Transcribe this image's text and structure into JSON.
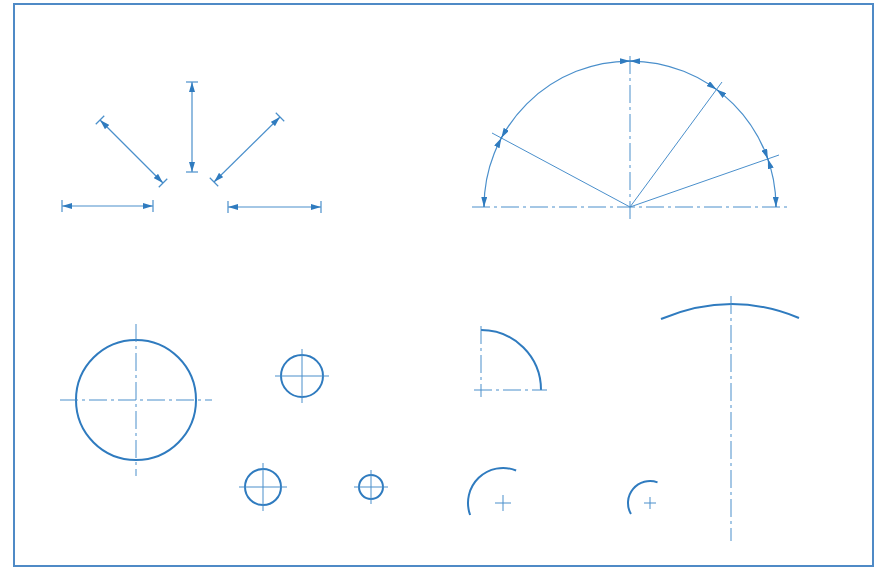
{
  "drawing": {
    "colors": {
      "line": "#2f7bbf",
      "thin": "#4a8fcb",
      "frame": "#4f8ac6",
      "background": "#ffffff"
    },
    "frame": {
      "x": 14,
      "y": 4,
      "w": 859,
      "h": 562
    },
    "dimension_arrows": [
      {
        "x1": 62,
        "y1": 206,
        "x2": 153,
        "y2": 206
      },
      {
        "x1": 100,
        "y1": 120,
        "x2": 163,
        "y2": 183
      },
      {
        "x1": 192,
        "y1": 82,
        "x2": 192,
        "y2": 172
      },
      {
        "x1": 280,
        "y1": 117,
        "x2": 214,
        "y2": 182
      },
      {
        "x1": 228,
        "y1": 207,
        "x2": 321,
        "y2": 207
      }
    ],
    "semicircle": {
      "cx": 630,
      "cy": 207,
      "r": 146,
      "centerline_h": {
        "x1": 472,
        "x2": 789
      },
      "centerline_v": {
        "y1": 56,
        "y2": 220
      },
      "radial_lines": [
        {
          "x2": 492,
          "y2": 133
        },
        {
          "x2": 722,
          "y2": 82
        },
        {
          "x2": 779,
          "y2": 155
        }
      ]
    },
    "circles": [
      {
        "cx": 136,
        "cy": 400,
        "r": 60,
        "ext": 16
      },
      {
        "cx": 302,
        "cy": 376,
        "r": 21,
        "ext": 6
      },
      {
        "cx": 263,
        "cy": 487,
        "r": 18,
        "ext": 6
      },
      {
        "cx": 371,
        "cy": 487,
        "r": 12,
        "ext": 5
      }
    ],
    "quarter_arc": {
      "cx": 481,
      "cy": 390,
      "r": 60
    },
    "partial_arcs": [
      {
        "cx": 503,
        "cy": 503,
        "r": 35,
        "start_deg": -68,
        "end_deg": -200,
        "cross": 8
      },
      {
        "cx": 650,
        "cy": 503,
        "r": 22,
        "start_deg": -70,
        "end_deg": -210,
        "cross": 6
      }
    ],
    "large_arc": {
      "x1": 661,
      "y1": 319,
      "x2": 799,
      "y2": 318,
      "top_y": 304,
      "axis_x": 731,
      "axis_y1": 296,
      "axis_y2": 541
    }
  }
}
